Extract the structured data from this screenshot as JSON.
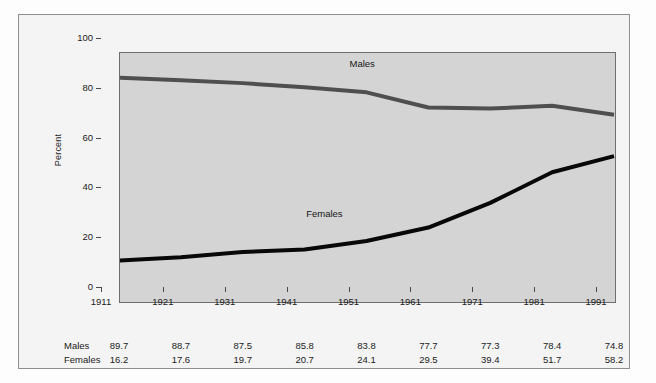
{
  "chart_data": {
    "type": "line",
    "title": "",
    "xlabel": "",
    "ylabel": "Percent",
    "categories": [
      "1911",
      "1921",
      "1931",
      "1941",
      "1951",
      "1961",
      "1971",
      "1981",
      "1991"
    ],
    "x": [
      1911,
      1921,
      1931,
      1941,
      1951,
      1961,
      1971,
      1981,
      1991
    ],
    "xlim": [
      1911,
      1991
    ],
    "ylim": [
      0,
      100
    ],
    "y_ticks": [
      0,
      20,
      40,
      60,
      80,
      100
    ],
    "y_tick_labels": [
      "0",
      "20",
      "40",
      "60",
      "80",
      "100"
    ],
    "grid": false,
    "legend_position": "inline-annotation",
    "series": [
      {
        "name": "Males",
        "color": "#4f4f4f",
        "line_width": 4,
        "values": [
          89.7,
          88.7,
          87.5,
          85.8,
          83.8,
          77.7,
          77.3,
          78.4,
          74.8
        ]
      },
      {
        "name": "Females",
        "color": "#080808",
        "line_width": 4,
        "values": [
          16.2,
          17.6,
          19.7,
          20.7,
          24.1,
          29.5,
          39.4,
          51.7,
          58.2
        ]
      }
    ],
    "annotations": [
      {
        "text": "Males",
        "x": 1951,
        "y": 95
      },
      {
        "text": "Females",
        "x": 1944,
        "y": 35
      }
    ]
  },
  "table": {
    "rows": [
      {
        "label": "Males",
        "cells": [
          "89.7",
          "88.7",
          "87.5",
          "85.8",
          "83.8",
          "77.7",
          "77.3",
          "78.4",
          "74.8"
        ]
      },
      {
        "label": "Females",
        "cells": [
          "16.2",
          "17.6",
          "19.7",
          "20.7",
          "24.1",
          "29.5",
          "39.4",
          "51.7",
          "58.2"
        ]
      }
    ]
  },
  "colors": {
    "males_line": "#4f4f4f",
    "females_line": "#080808",
    "plot_background": "#d4d4d4",
    "figure_background": "#f4f4f4",
    "axis": "#4a4a4a",
    "text": "#1b1b1b"
  }
}
